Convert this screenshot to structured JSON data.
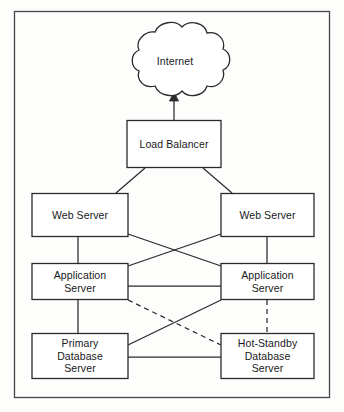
{
  "diagram": {
    "type": "network-architecture",
    "style": {
      "background_color": "#fdfdfc",
      "line_color": "#2b2b2e",
      "frame_color": "#45454a",
      "text_color": "#18181a",
      "node_fill": "#ffffff"
    },
    "frame": {
      "label": "diagram-border"
    },
    "nodes": {
      "internet": {
        "label": "Internet",
        "shape": "cloud"
      },
      "load_balancer": {
        "label": "Load Balancer",
        "shape": "rectangle"
      },
      "web_server_left": {
        "label": "Web Server",
        "shape": "rectangle"
      },
      "web_server_right": {
        "label": "Web Server",
        "shape": "rectangle"
      },
      "app_server_left": {
        "label": "Application\nServer",
        "shape": "rectangle"
      },
      "app_server_right": {
        "label": "Application\nServer",
        "shape": "rectangle"
      },
      "db_primary": {
        "label": "Primary\nDatabase\nServer",
        "shape": "rectangle"
      },
      "db_standby": {
        "label": "Hot-Standby\nDatabase\nServer",
        "shape": "rectangle"
      }
    },
    "edges": [
      {
        "name": "load-balancer-to-internet",
        "from": "load_balancer",
        "to": "internet",
        "style": "solid",
        "arrow": "to-internet"
      },
      {
        "name": "load-balancer-to-web-left",
        "from": "load_balancer",
        "to": "web_server_left",
        "style": "solid",
        "arrow": "none"
      },
      {
        "name": "load-balancer-to-web-right",
        "from": "load_balancer",
        "to": "web_server_right",
        "style": "solid",
        "arrow": "none"
      },
      {
        "name": "web-left-to-app-left",
        "from": "web_server_left",
        "to": "app_server_left",
        "style": "solid",
        "arrow": "none"
      },
      {
        "name": "web-right-to-app-right",
        "from": "web_server_right",
        "to": "app_server_right",
        "style": "solid",
        "arrow": "none"
      },
      {
        "name": "web-left-to-app-right",
        "from": "web_server_left",
        "to": "app_server_right",
        "style": "solid",
        "arrow": "none"
      },
      {
        "name": "web-right-to-app-left",
        "from": "web_server_right",
        "to": "app_server_left",
        "style": "solid",
        "arrow": "none"
      },
      {
        "name": "app-left-to-app-right",
        "from": "app_server_left",
        "to": "app_server_right",
        "style": "solid",
        "arrow": "none"
      },
      {
        "name": "app-left-to-db-primary",
        "from": "app_server_left",
        "to": "db_primary",
        "style": "solid",
        "arrow": "none"
      },
      {
        "name": "db-primary-to-app-right",
        "from": "db_primary",
        "to": "app_server_right",
        "style": "solid",
        "arrow": "none"
      },
      {
        "name": "app-left-to-db-standby",
        "from": "app_server_left",
        "to": "db_standby",
        "style": "dashed",
        "arrow": "none"
      },
      {
        "name": "app-right-to-db-standby",
        "from": "app_server_right",
        "to": "db_standby",
        "style": "dashed",
        "arrow": "none"
      },
      {
        "name": "db-primary-to-db-standby",
        "from": "db_primary",
        "to": "db_standby",
        "style": "solid",
        "arrow": "none"
      }
    ]
  }
}
